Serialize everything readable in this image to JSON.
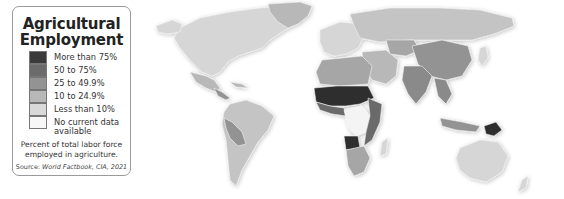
{
  "legend": {
    "title_line1": "Agricultural",
    "title_line2": "Employment",
    "items": [
      {
        "label": "More than 75%",
        "color": "#3a3a3a"
      },
      {
        "label": "50 to 75%",
        "color": "#6b6b6b"
      },
      {
        "label": "25 to 49.9%",
        "color": "#939393"
      },
      {
        "label": "10 to 24.9%",
        "color": "#b8b8b8"
      },
      {
        "label": "Less than 10%",
        "color": "#d9d9d9"
      },
      {
        "label_line1": "No current data",
        "label_line2": "available",
        "color": "#f7f7f7"
      }
    ],
    "note_line1": "Percent of total labor force",
    "note_line2": "employed in agriculture.",
    "source_prefix": "Source: ",
    "source_text": "World Factbook, CIA, 2021"
  },
  "map": {
    "regions": [
      {
        "name": "North America",
        "category": "Less than 10%"
      },
      {
        "name": "Greenland",
        "category": "10 to 24.9%"
      },
      {
        "name": "Mexico",
        "category": "10 to 24.9%"
      },
      {
        "name": "Central America",
        "category": "25 to 49.9%"
      },
      {
        "name": "South America (Brazil, Argentina)",
        "category": "10 to 24.9%"
      },
      {
        "name": "Peru/Bolivia",
        "category": "25 to 49.9%"
      },
      {
        "name": "Europe",
        "category": "Less than 10%"
      },
      {
        "name": "Russia",
        "category": "10 to 24.9%"
      },
      {
        "name": "North Africa",
        "category": "25 to 49.9%"
      },
      {
        "name": "Sahel/West Africa",
        "category": "More than 75%"
      },
      {
        "name": "Central Africa (DR Congo)",
        "category": "No current data available"
      },
      {
        "name": "East Africa",
        "category": "50 to 75%"
      },
      {
        "name": "Southern Africa",
        "category": "25 to 49.9%"
      },
      {
        "name": "Middle East",
        "category": "10 to 24.9%"
      },
      {
        "name": "China",
        "category": "25 to 49.9%"
      },
      {
        "name": "India",
        "category": "25 to 49.9%"
      },
      {
        "name": "Southeast Asia",
        "category": "25 to 49.9%"
      },
      {
        "name": "Papua New Guinea",
        "category": "More than 75%"
      },
      {
        "name": "Australia",
        "category": "Less than 10%"
      }
    ]
  }
}
